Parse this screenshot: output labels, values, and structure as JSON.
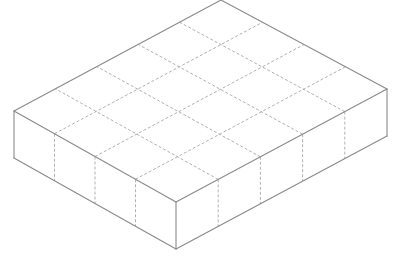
{
  "diagram": {
    "type": "isometric-box",
    "grid": {
      "columns_left_face": 4,
      "columns_right_face": 5
    },
    "vertices": {
      "top_back": [
        221,
        0
      ],
      "top_left": [
        14,
        111
      ],
      "top_front": [
        176,
        202
      ],
      "top_right": [
        387,
        89
      ],
      "bottom_left": [
        14,
        158
      ],
      "bottom_front": [
        176,
        249
      ],
      "bottom_right": [
        387,
        136
      ]
    },
    "colors": {
      "edge": "#8a8a8a",
      "grid": "#a8a8a8",
      "background": "#ffffff"
    }
  }
}
